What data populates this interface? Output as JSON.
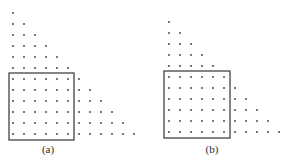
{
  "figure": {
    "colors": {
      "dot": "#3a3a3a",
      "box": "#444444",
      "background": "#ffffff"
    },
    "panels": [
      {
        "id": "a",
        "label": "(a)",
        "label_pos": {
          "x": 48,
          "y": 143
        },
        "origin": {
          "x": 13,
          "y": 13
        },
        "spacing": 11,
        "triangle_rows_above_box": [
          1,
          2,
          3,
          4,
          5,
          6
        ],
        "box_size": 6,
        "extras_right_of_box": [
          1,
          2,
          3,
          4,
          5,
          6
        ],
        "box_rect": {
          "x": 9,
          "y": 73,
          "w": 65,
          "h": 67
        }
      },
      {
        "id": "b",
        "label": "(b)",
        "label_pos": {
          "x": 212,
          "y": 143
        },
        "origin": {
          "x": 169,
          "y": 22
        },
        "spacing": 11,
        "triangle_rows_above_box": [
          1,
          2,
          3,
          4,
          5
        ],
        "box_size": 6,
        "extras_right_of_box": [
          0,
          1,
          2,
          3,
          4,
          5
        ],
        "box_rect": {
          "x": 164,
          "y": 71,
          "w": 66,
          "h": 67
        }
      }
    ]
  }
}
